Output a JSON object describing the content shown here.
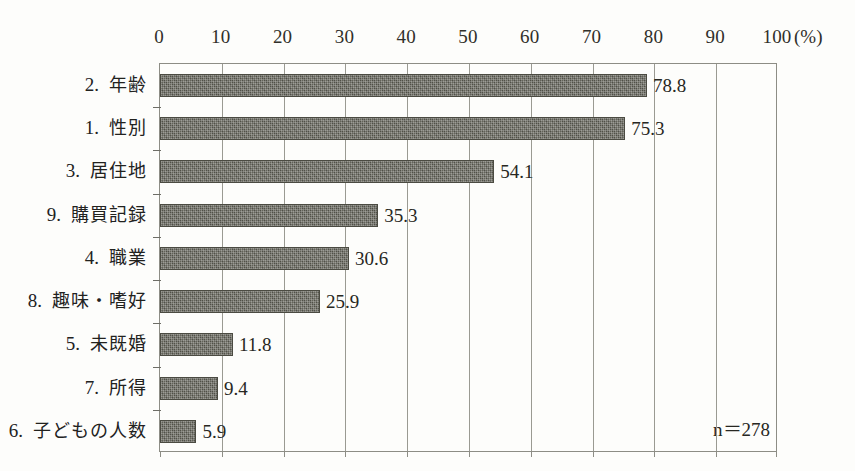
{
  "chart_data": {
    "type": "bar",
    "orientation": "horizontal",
    "title": "",
    "subtitle": "",
    "xlabel": "(%)",
    "ylabel": "",
    "xlim": [
      0,
      100
    ],
    "grid": true,
    "legend": null,
    "categories": [
      "2．年齢",
      "1．性別",
      "3．居住地",
      "9．購買記録",
      "4．職業",
      "8．趣味・嗜好",
      "5．未既婚",
      "7．所得",
      "6．子どもの人数"
    ],
    "category_parts": [
      {
        "num": "2.",
        "jp": "年齢"
      },
      {
        "num": "1.",
        "jp": "性別"
      },
      {
        "num": "3.",
        "jp": "居住地"
      },
      {
        "num": "9.",
        "jp": "購買記録"
      },
      {
        "num": "4.",
        "jp": "職業"
      },
      {
        "num": "8.",
        "jp": "趣味・嗜好"
      },
      {
        "num": "5.",
        "jp": "未既婚"
      },
      {
        "num": "7.",
        "jp": "所得"
      },
      {
        "num": "6.",
        "jp": "子どもの人数"
      }
    ],
    "values": [
      78.8,
      75.3,
      54.1,
      35.3,
      30.6,
      25.9,
      11.8,
      9.4,
      5.9
    ],
    "value_labels": [
      "78.8",
      "75.3",
      "54.1",
      "35.3",
      "30.6",
      "25.9",
      "11.8",
      "9.4",
      "5.9"
    ],
    "xticks": [
      0,
      10,
      20,
      30,
      40,
      50,
      60,
      70,
      80,
      90,
      100
    ],
    "xtick_labels": [
      "0",
      "10",
      "20",
      "30",
      "40",
      "50",
      "60",
      "70",
      "80",
      "90",
      "100"
    ],
    "annotation": "n＝278",
    "bar_color": "#59594f",
    "grid_color": "#9a9a92",
    "axis_color": "#8d8d85",
    "background_color": "#fdfdfb",
    "text_color": "#272722"
  }
}
